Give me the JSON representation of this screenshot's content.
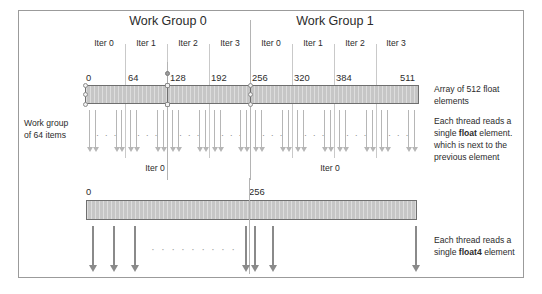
{
  "figure": {
    "title_hidden": "OpenCL memory access pattern: float vs float4",
    "work_groups": [
      {
        "label": "Work Group 0"
      },
      {
        "label": "Work Group 1"
      }
    ],
    "iteration_labels": [
      "Iter 0",
      "Iter 1",
      "Iter 2",
      "Iter 3",
      "Iter 0",
      "Iter 1",
      "Iter 2",
      "Iter 3"
    ],
    "top_bar": {
      "index_labels": [
        "0",
        "64",
        "128",
        "192",
        "256",
        "320",
        "384",
        "511"
      ],
      "caption": "Array of 512 float elements",
      "caption_lines": [
        "Array of 512 float",
        "elements"
      ]
    },
    "left_label": {
      "lines": [
        "Work group",
        "of 64 items"
      ],
      "text": "Work group of 64 items"
    },
    "middle_iter_labels": [
      "Iter 0",
      "Iter 0"
    ],
    "float_note": {
      "line1": "Each thread reads a",
      "line2_pre": "single ",
      "line2_bold": "float",
      "line2_post": " element.",
      "line3": "which is next to the",
      "line4": "previous element",
      "text": "Each thread reads a single float element. which is next to the previous element"
    },
    "bottom_bar": {
      "index_labels": [
        "0",
        "256"
      ]
    },
    "float4_note": {
      "line1": "Each thread reads a",
      "line2_pre": "single ",
      "line2_bold": "float4",
      "line2_post": " element",
      "text": "Each thread reads a single float4 element"
    },
    "ellipsis": "· · ·",
    "colors": {
      "bar_fill": "#c6c6c6",
      "bar_stroke": "#6f6f6f",
      "frame": "#9b9b9b",
      "divider": "#c9c9c9",
      "arrow": "#b6b6b6",
      "arrow_dark": "#8a8a8a",
      "text": "#2b2b2b",
      "background": "#ffffff"
    }
  }
}
